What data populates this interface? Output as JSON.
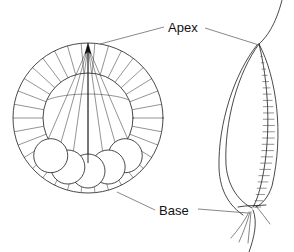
{
  "figure": {
    "background_color": "#ffffff",
    "line_color": "#1a1a1a",
    "width": 294,
    "height": 252
  },
  "labels": {
    "apex": "Apex",
    "base": "Base"
  },
  "views": {
    "left": {
      "name": "transverse-section-view",
      "center_x": 88,
      "center_y": 118,
      "outer_radius": 75,
      "inner_radius": 45,
      "spoke_count": 34,
      "apex_ray_count": 7,
      "base_circle_count": 5,
      "base_circle_radius": 17
    },
    "right": {
      "name": "lateral-section-view",
      "hatch_count": 27,
      "tendril_count": 4
    }
  },
  "annotations": {
    "apex_leader_left": "leader from Apex label to left figure apex",
    "apex_leader_right": "leader from Apex label to right figure apex",
    "base_leader_left": "leader from Base label to left figure base",
    "base_leader_right": "leader from Base label to right figure base"
  }
}
